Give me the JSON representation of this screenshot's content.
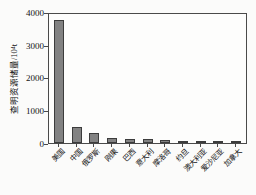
{
  "chart_data": {
    "type": "bar",
    "title": "",
    "xlabel": "",
    "ylabel": "查明资源储量/10⁴t",
    "categories": [
      "美国",
      "中国",
      "俄罗斯",
      "刚果",
      "巴西",
      "意大利",
      "摩洛哥",
      "约旦",
      "澳大利亚",
      "爱沙尼亚",
      "加拿大"
    ],
    "values": [
      3750,
      480,
      310,
      150,
      130,
      115,
      95,
      75,
      60,
      30,
      25
    ],
    "ylim": [
      0,
      4000
    ],
    "yticks": [
      "0",
      "1000",
      "2000",
      "3000",
      "4000"
    ],
    "grid": false,
    "legend": "none",
    "bar_fill_color": "#828282",
    "bar_edge_color": "#3c3c3c",
    "axis_color": "#4a4a4a",
    "background_color": "#fbfbfa"
  }
}
